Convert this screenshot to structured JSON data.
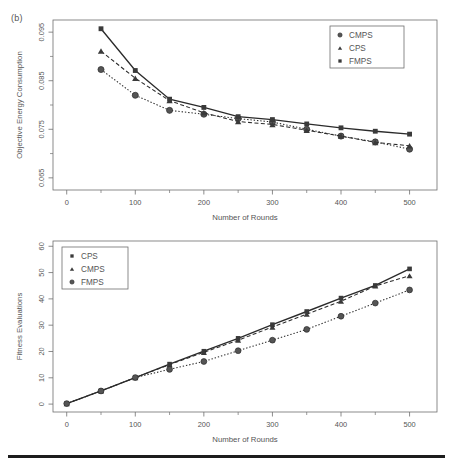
{
  "figure": {
    "panel_label": "(b)",
    "background_color": "#ffffff",
    "line_color": "#2b2b2b",
    "marker_color": "#555555",
    "axis_color": "#6e6e6e"
  },
  "chart_data": [
    {
      "type": "line",
      "id": "objective-energy-consumption",
      "title": "",
      "xlabel": "Number of Rounds",
      "ylabel": "Objective Energy Consumption",
      "xlim": [
        -20,
        540
      ],
      "ylim": [
        0.0625,
        0.0975
      ],
      "xticks": [
        0,
        100,
        200,
        300,
        400,
        500
      ],
      "xtick_labels": [
        "0",
        "100",
        "200",
        "300",
        "400",
        "500"
      ],
      "xminor_ticks": [
        50,
        150,
        250,
        350,
        450
      ],
      "yticks": [
        0.065,
        0.075,
        0.085,
        0.095
      ],
      "ytick_labels": [
        "0.065",
        "0.075",
        "0.085",
        "0.095"
      ],
      "yminor_ticks": [
        0.07,
        0.08,
        0.09
      ],
      "grid": false,
      "legend_position": "top-right",
      "x": [
        50,
        100,
        150,
        200,
        250,
        300,
        350,
        400,
        450,
        500
      ],
      "series": [
        {
          "name": "CMPS",
          "marker": "circle",
          "linestyle": "dotted",
          "values": [
            0.0873,
            0.082,
            0.0789,
            0.0781,
            0.0772,
            0.0765,
            0.075,
            0.0736,
            0.0724,
            0.0709
          ]
        },
        {
          "name": "CPS",
          "marker": "triangle",
          "linestyle": "dashed",
          "values": [
            0.0911,
            0.0855,
            0.0809,
            0.0784,
            0.0766,
            0.076,
            0.0748,
            0.0736,
            0.0723,
            0.0716
          ]
        },
        {
          "name": "FMPS",
          "marker": "square",
          "linestyle": "solid",
          "values": [
            0.0957,
            0.0871,
            0.0812,
            0.0795,
            0.0776,
            0.077,
            0.0761,
            0.0753,
            0.0746,
            0.074
          ]
        }
      ],
      "legend": [
        "CMPS",
        "CPS",
        "FMPS"
      ]
    },
    {
      "type": "line",
      "id": "fitness-evaluations",
      "title": "",
      "xlabel": "Number of Rounds",
      "ylabel": "Fitness Evaluations",
      "xlim": [
        -20,
        540
      ],
      "ylim": [
        -3,
        62
      ],
      "xticks": [
        0,
        100,
        200,
        300,
        400,
        500
      ],
      "xtick_labels": [
        "0",
        "100",
        "200",
        "300",
        "400",
        "500"
      ],
      "xminor_ticks": [
        50,
        150,
        250,
        350,
        450
      ],
      "yticks": [
        0,
        10,
        20,
        30,
        40,
        50,
        60
      ],
      "ytick_labels": [
        "0",
        "10",
        "20",
        "30",
        "40",
        "50",
        "60"
      ],
      "grid": false,
      "legend_position": "top-left",
      "x": [
        0,
        50,
        100,
        150,
        200,
        250,
        300,
        350,
        400,
        450,
        500
      ],
      "series": [
        {
          "name": "CPS",
          "marker": "square",
          "linestyle": "solid",
          "values": [
            0.2,
            5.0,
            10.1,
            15.2,
            20.1,
            25.0,
            30.2,
            35.2,
            40.3,
            45.1,
            51.4
          ]
        },
        {
          "name": "CMPS",
          "marker": "triangle",
          "linestyle": "dashed",
          "values": [
            0.2,
            5.0,
            10.1,
            15.0,
            19.7,
            24.3,
            29.3,
            34.2,
            39.1,
            44.9,
            48.8
          ]
        },
        {
          "name": "FMPS",
          "marker": "circle",
          "linestyle": "dotted",
          "values": [
            0.2,
            5.0,
            10.1,
            13.2,
            16.2,
            20.3,
            24.3,
            28.4,
            33.4,
            38.4,
            43.4
          ]
        }
      ],
      "legend": [
        "CPS",
        "CMPS",
        "FMPS"
      ]
    }
  ]
}
